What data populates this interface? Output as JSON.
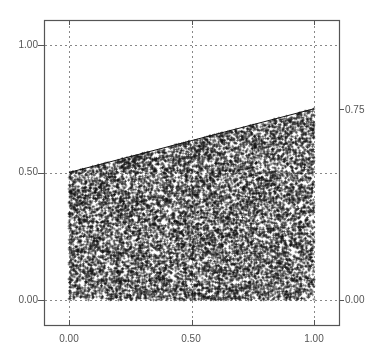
{
  "chart_data": {
    "type": "scatter",
    "title": "",
    "xlabel": "",
    "ylabel": "",
    "xlim": [
      -0.1,
      1.1
    ],
    "ylim": [
      -0.1,
      1.1
    ],
    "grid": true,
    "legend": null,
    "marker": "+",
    "marker_color": "#111111",
    "region": {
      "x_range": [
        0,
        1
      ],
      "y_lower": 0,
      "y_upper_line": {
        "x": [
          0.0,
          1.0
        ],
        "y": [
          0.5,
          0.75
        ]
      }
    },
    "approx_point_count": 12000,
    "series": [
      {
        "name": "points",
        "type": "scatter",
        "marker": "+"
      },
      {
        "name": "upper boundary",
        "type": "line",
        "x": [
          0.0,
          1.0
        ],
        "y": [
          0.5,
          0.75
        ]
      }
    ],
    "x_ticks": [
      {
        "value": 0.0,
        "label": "0.00"
      },
      {
        "value": 0.5,
        "label": "0.50"
      },
      {
        "value": 1.0,
        "label": "1.00"
      }
    ],
    "y_ticks_left": [
      {
        "value": 0.0,
        "label": "0.00"
      },
      {
        "value": 0.5,
        "label": "0.50"
      },
      {
        "value": 1.0,
        "label": "1.00"
      }
    ],
    "y_ticks_right": [
      {
        "value": 0.0,
        "label": "0.00"
      },
      {
        "value": 0.75,
        "label": "0.75"
      }
    ],
    "gridlines": {
      "x": [
        0.0,
        0.5,
        1.0
      ],
      "y": [
        0.0,
        0.5,
        1.0
      ]
    }
  },
  "axes": {
    "x_tick_labels": [
      "0.00",
      "0.50",
      "1.00"
    ],
    "y_left_tick_labels": [
      "1.00",
      "0.50",
      "0.00"
    ],
    "y_right_tick_labels": [
      "0.75",
      "0.00"
    ]
  },
  "colors": {
    "frame": "#555555",
    "grid": "#888888",
    "points": "#111111",
    "text": "#555555"
  }
}
